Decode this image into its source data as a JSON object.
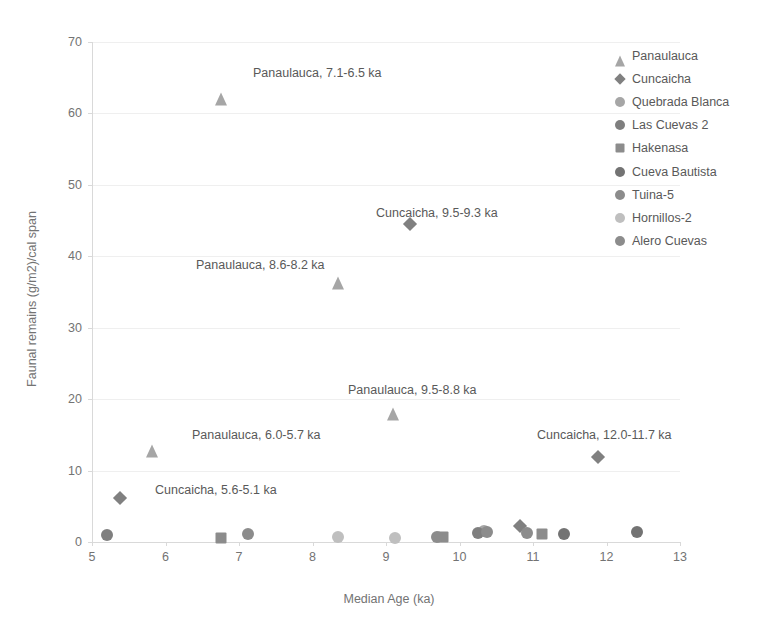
{
  "chart_data": {
    "type": "scatter",
    "title": "",
    "xlabel": "Median Age (ka)",
    "ylabel": "Faunal remains (g/m2)/cal span",
    "xlim": [
      5,
      13
    ],
    "ylim": [
      0,
      70
    ],
    "xticks": [
      "5",
      "6",
      "7",
      "8",
      "9",
      "10",
      "11",
      "12",
      "13"
    ],
    "yticks": [
      "0",
      "10",
      "20",
      "30",
      "40",
      "50",
      "60",
      "70"
    ],
    "grid": "horizontal",
    "legend_position": "right",
    "series": [
      {
        "name": "Panaulauca",
        "marker": "triangle",
        "color": "#a6a6a6",
        "points": [
          {
            "x": 6.75,
            "y": 63.0
          },
          {
            "x": 8.35,
            "y": 37.2
          },
          {
            "x": 9.1,
            "y": 18.9
          },
          {
            "x": 5.82,
            "y": 13.6
          }
        ]
      },
      {
        "name": "Cuncaicha",
        "marker": "diamond",
        "color": "#808080",
        "points": [
          {
            "x": 9.33,
            "y": 44.5
          },
          {
            "x": 11.88,
            "y": 11.9
          },
          {
            "x": 5.38,
            "y": 6.1
          },
          {
            "x": 10.82,
            "y": 2.3
          }
        ]
      },
      {
        "name": "Quebrada Blanca",
        "marker": "circle",
        "color": "#a6a6a6",
        "points": [
          {
            "x": 10.33,
            "y": 1.5
          }
        ]
      },
      {
        "name": "Las Cuevas  2",
        "marker": "circle",
        "color": "#7f7f7f",
        "points": [
          {
            "x": 5.2,
            "y": 1.0
          },
          {
            "x": 10.25,
            "y": 1.2
          }
        ]
      },
      {
        "name": "Hakenasa",
        "marker": "square",
        "color": "#8c8c8c",
        "points": [
          {
            "x": 6.75,
            "y": 0.6
          },
          {
            "x": 9.78,
            "y": 0.7
          },
          {
            "x": 11.12,
            "y": 1.1
          }
        ]
      },
      {
        "name": "Cueva Bautista",
        "marker": "circle",
        "color": "#737373",
        "points": [
          {
            "x": 11.42,
            "y": 1.1
          },
          {
            "x": 12.42,
            "y": 1.4
          }
        ]
      },
      {
        "name": "Tuina-5",
        "marker": "circle",
        "color": "#8c8c8c",
        "points": [
          {
            "x": 7.12,
            "y": 1.1
          },
          {
            "x": 10.92,
            "y": 1.2
          }
        ]
      },
      {
        "name": "Hornillos-2",
        "marker": "circle",
        "color": "#bfbfbf",
        "points": [
          {
            "x": 8.35,
            "y": 0.7
          },
          {
            "x": 9.12,
            "y": 0.6
          }
        ]
      },
      {
        "name": "Alero Cuevas",
        "marker": "circle",
        "color": "#8c8c8c",
        "points": [
          {
            "x": 9.7,
            "y": 0.7
          },
          {
            "x": 10.38,
            "y": 1.4
          }
        ]
      }
    ],
    "annotations": [
      {
        "text": "Panaulauca, 7.1-6.5 ka",
        "x": 253,
        "y": 66
      },
      {
        "text": "Cuncaicha, 9.5-9.3 ka",
        "x": 376,
        "y": 206
      },
      {
        "text": "Panaulauca, 8.6-8.2 ka",
        "x": 196,
        "y": 258
      },
      {
        "text": "Panaulauca, 9.5-8.8 ka",
        "x": 348,
        "y": 383
      },
      {
        "text": "Panaulauca, 6.0-5.7 ka",
        "x": 192,
        "y": 428
      },
      {
        "text": "Cuncaicha, 12.0-11.7 ka",
        "x": 537,
        "y": 428
      },
      {
        "text": "Cuncaicha, 5.6-5.1 ka",
        "x": 155,
        "y": 483
      }
    ]
  },
  "legend": {
    "items": [
      {
        "label": "Panaulauca",
        "marker": "triangle",
        "color": "#a6a6a6"
      },
      {
        "label": "Cuncaicha",
        "marker": "diamond",
        "color": "#808080"
      },
      {
        "label": "Quebrada Blanca",
        "marker": "circle",
        "color": "#a6a6a6"
      },
      {
        "label": "Las Cuevas  2",
        "marker": "circle",
        "color": "#7f7f7f"
      },
      {
        "label": "Hakenasa",
        "marker": "square",
        "color": "#8c8c8c"
      },
      {
        "label": "Cueva Bautista",
        "marker": "circle",
        "color": "#737373"
      },
      {
        "label": "Tuina-5",
        "marker": "circle",
        "color": "#8c8c8c"
      },
      {
        "label": "Hornillos-2",
        "marker": "circle",
        "color": "#bfbfbf"
      },
      {
        "label": "Alero Cuevas",
        "marker": "circle",
        "color": "#8c8c8c"
      }
    ]
  }
}
